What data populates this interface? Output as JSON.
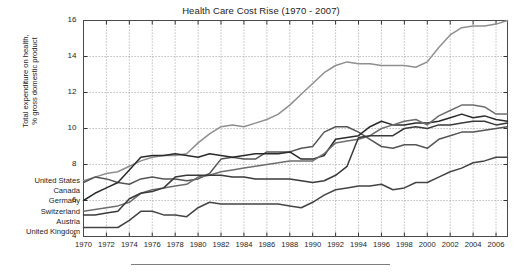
{
  "chart_data": {
    "type": "line",
    "title": "Health Care Cost Rise (1970 - 2007)",
    "xlabel": "",
    "ylabel": "Total expenditure on health,\n% gross domestic product",
    "ylabel_line1": "Total expenditure on health,",
    "ylabel_line2": "% gross domestic product",
    "xlim": [
      1970,
      2007
    ],
    "ylim": [
      4,
      16
    ],
    "yticks": [
      4,
      6,
      8,
      10,
      12,
      14,
      16
    ],
    "xticks": [
      1970,
      1972,
      1974,
      1976,
      1978,
      1980,
      1982,
      1984,
      1986,
      1988,
      1990,
      1992,
      1994,
      1996,
      1998,
      2000,
      2002,
      2004,
      2006
    ],
    "grid": true,
    "legend_position": "left-outside",
    "x": [
      1970,
      1971,
      1972,
      1973,
      1974,
      1975,
      1976,
      1977,
      1978,
      1979,
      1980,
      1981,
      1982,
      1983,
      1984,
      1985,
      1986,
      1987,
      1988,
      1989,
      1990,
      1991,
      1992,
      1993,
      1994,
      1995,
      1996,
      1997,
      1998,
      1999,
      2000,
      2001,
      2002,
      2003,
      2004,
      2005,
      2006,
      2007
    ],
    "series": [
      {
        "name": "United States",
        "color": "#8f8f8f",
        "values": [
          7.1,
          7.3,
          7.5,
          7.6,
          7.9,
          8.2,
          8.4,
          8.5,
          8.5,
          8.6,
          9.2,
          9.7,
          10.1,
          10.2,
          10.1,
          10.3,
          10.5,
          10.8,
          11.3,
          11.9,
          12.5,
          13.1,
          13.5,
          13.7,
          13.6,
          13.6,
          13.5,
          13.5,
          13.5,
          13.4,
          13.7,
          14.5,
          15.2,
          15.6,
          15.7,
          15.7,
          15.8,
          16.0
        ]
      },
      {
        "name": "Canada",
        "color": "#555555",
        "values": [
          7.0,
          7.3,
          7.2,
          7.0,
          6.9,
          7.2,
          7.3,
          7.2,
          7.2,
          7.1,
          7.2,
          7.5,
          8.3,
          8.4,
          8.3,
          8.3,
          8.7,
          8.7,
          8.7,
          8.9,
          9.0,
          9.8,
          10.1,
          10.1,
          9.8,
          9.4,
          9.0,
          8.9,
          9.1,
          9.1,
          8.9,
          9.4,
          9.6,
          9.8,
          9.8,
          9.9,
          10.0,
          10.1
        ]
      },
      {
        "name": "Germany",
        "color": "#2b2b2b",
        "values": [
          6.0,
          6.4,
          6.7,
          7.0,
          7.7,
          8.4,
          8.5,
          8.5,
          8.6,
          8.5,
          8.4,
          8.6,
          8.5,
          8.4,
          8.5,
          8.6,
          8.6,
          8.6,
          8.7,
          8.3,
          8.3,
          8.5,
          9.4,
          9.5,
          9.6,
          10.1,
          10.4,
          10.2,
          10.2,
          10.3,
          10.3,
          10.4,
          10.6,
          10.8,
          10.6,
          10.7,
          10.5,
          10.4
        ]
      },
      {
        "name": "Switzerland",
        "color": "#6e6e6e",
        "values": [
          5.4,
          5.5,
          5.6,
          5.7,
          5.9,
          6.4,
          6.6,
          6.7,
          6.8,
          6.9,
          7.3,
          7.4,
          7.6,
          7.7,
          7.8,
          7.9,
          8.0,
          8.1,
          8.2,
          8.2,
          8.2,
          8.6,
          9.2,
          9.3,
          9.4,
          9.6,
          10.0,
          10.2,
          10.4,
          10.5,
          10.2,
          10.7,
          11.0,
          11.3,
          11.3,
          11.2,
          10.8,
          10.8
        ]
      },
      {
        "name": "Austria",
        "color": "#3a3a3a",
        "values": [
          5.2,
          5.2,
          5.3,
          5.4,
          6.1,
          6.4,
          6.5,
          6.7,
          7.3,
          7.4,
          7.4,
          7.4,
          7.4,
          7.3,
          7.3,
          7.2,
          7.2,
          7.2,
          7.2,
          7.1,
          7.0,
          7.1,
          7.4,
          7.9,
          9.5,
          9.6,
          9.6,
          9.6,
          10.0,
          10.1,
          10.0,
          10.2,
          10.2,
          10.3,
          10.4,
          10.4,
          10.2,
          10.3
        ]
      },
      {
        "name": "United Kingdom",
        "color": "#444444",
        "values": [
          4.5,
          4.5,
          4.5,
          4.5,
          4.9,
          5.4,
          5.4,
          5.2,
          5.2,
          5.1,
          5.6,
          5.9,
          5.8,
          5.8,
          5.8,
          5.8,
          5.8,
          5.8,
          5.7,
          5.6,
          5.9,
          6.3,
          6.6,
          6.7,
          6.8,
          6.8,
          6.9,
          6.6,
          6.7,
          7.0,
          7.0,
          7.3,
          7.6,
          7.8,
          8.1,
          8.2,
          8.4,
          8.4
        ]
      }
    ]
  },
  "legend": {
    "entries": [
      {
        "label": "United States"
      },
      {
        "label": "Canada"
      },
      {
        "label": "Germany"
      },
      {
        "label": "Switzerland"
      },
      {
        "label": "Austria"
      },
      {
        "label": "United Kingdom"
      }
    ]
  }
}
